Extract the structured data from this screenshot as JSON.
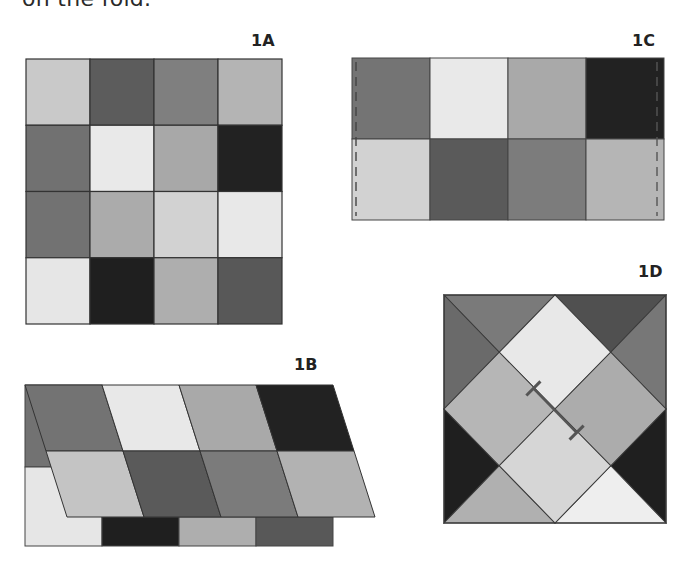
{
  "caption": "on the fold.",
  "colors": {
    "c1": "#c9c9c9",
    "c2": "#5c5c5c",
    "c3": "#7f7f7f",
    "c4": "#b4b4b4",
    "c5": "#717171",
    "c6": "#e6e6e6",
    "c7": "#a8a8a8",
    "c8": "#232323",
    "c9": "#d8d8d8",
    "c10": "#eeeeee",
    "c11": "#4f4f4f",
    "line": "#4a4a4a"
  },
  "figures": {
    "fig1A": {
      "label": "1A",
      "grid": [
        [
          "#c9c9c9",
          "#5c5c5c",
          "#7f7f7f",
          "#b4b4b4"
        ],
        [
          "#717171",
          "#e9e9e9",
          "#a8a8a8",
          "#222222"
        ],
        [
          "#727272",
          "#ababab",
          "#d2d2d2",
          "#e8e8e8"
        ],
        [
          "#e6e6e6",
          "#1f1f1f",
          "#aeaeae",
          "#585858"
        ]
      ]
    },
    "fig1B": {
      "label": "1B",
      "top_row": [
        "#737373",
        "#e8e8e8",
        "#a9a9a9",
        "#222222"
      ],
      "middle_row": [
        "#c4c4c4",
        "#5a5a5a",
        "#7b7b7b",
        "#b2b2b2"
      ],
      "under_row": [
        "#e6e6e6",
        "#1f1f1f",
        "#aeaeae",
        "#585858"
      ],
      "under_left_top": "#727272"
    },
    "fig1C": {
      "label": "1C",
      "rows": [
        [
          "#747474",
          "#e9e9e9",
          "#a9a9a9",
          "#222222"
        ],
        [
          "#d2d2d2",
          "#5a5a5a",
          "#7c7c7c",
          "#b5b5b5"
        ]
      ],
      "fold_lines": "dashed"
    },
    "fig1D": {
      "label": "1D",
      "regions": {
        "top_diamond": "#e8e8e8",
        "left_diamond": "#b6b6b6",
        "right_diamond": "#acacac",
        "bottom_diamond": "#d6d6d6",
        "tri_top_left": "#7a7a7a",
        "tri_left_top": "#6a6a6a",
        "tri_top_right": "#505050",
        "tri_right_top": "#777777",
        "tri_left_bottom": "#1f1f1f",
        "tri_bottom_left": "#b0b0b0",
        "tri_right_bottom": "#1f1f1f",
        "tri_bottom_right": "#eeeeee"
      }
    }
  }
}
